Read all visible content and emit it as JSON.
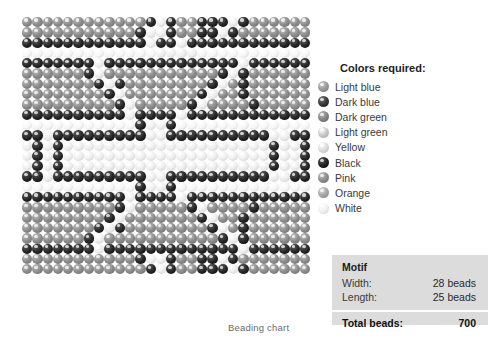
{
  "chart": {
    "caption": "Beading chart",
    "width_beads": 28,
    "length_beads": 25
  },
  "legend": {
    "title": "Colors required:",
    "items": [
      {
        "label": "Light blue",
        "color": "#9a9a9a"
      },
      {
        "label": "Dark blue",
        "color": "#3c3c3c"
      },
      {
        "label": "Dark green",
        "color": "#858585"
      },
      {
        "label": "Light green",
        "color": "#c9c9c9"
      },
      {
        "label": "Yellow",
        "color": "#dcdcdc"
      },
      {
        "label": "Black",
        "color": "#242424"
      },
      {
        "label": "Pink",
        "color": "#8e8e8e"
      },
      {
        "label": "Orange",
        "color": "#a8a8a8"
      },
      {
        "label": "White",
        "color": "#f2f2f2"
      }
    ]
  },
  "motif": {
    "title": "Motif",
    "width_label": "Width:",
    "width_value": "28 beads",
    "length_label": "Length:",
    "length_value": "25 beads",
    "total_label": "Total beads:",
    "total_value": "700"
  },
  "chart_data": {
    "type": "heatmap",
    "title": "Beading chart",
    "cols": 28,
    "rows": 25,
    "palette": {
      "D": "#2a2a2a",
      "d": "#4a4a4a",
      "m": "#8d8d8d",
      "l": "#bdbdbd",
      "w": "#efefef",
      "x": "#f7f7f7"
    },
    "palette_names": {
      "D": "Black",
      "d": "Dark blue",
      "m": "Light blue",
      "l": "Light green",
      "w": "White",
      "x": "Yellow"
    },
    "grid": [
      "mmmmmmmmmmmmDwDmmDDDwDmmmmmm",
      "mmmmmmmmmmmDwwDmmDDwDmmmmmmm",
      "DDDDDDDDDDDDwDDwDDDDDDDDDDDD",
      "xxxxxxxxxxxxxwwwwxxxxxxxxxxx",
      "DDDDDDDwDDDDDDDDDDDDDwDDDDDD",
      "mmmmmmDwmmmmmmmmmmmDwDmmmmmm",
      "mmmmmmmDwDmmmmmmmmDwmDmmmmmm",
      "mmmmmmmmDwmmmmmmmDwmmDmmmmmm",
      "mmmmmmmmmDwmmmmmDwmmmmDmmmmm",
      "DDDDDDDDDDwDDDDwDDDDDDDDDDDD",
      "xxxxxxxxxxxDwwDxxxxxxxxxxxxx",
      "DDwDDDDDDDDDwwDDDDDDDDDDwwDD",
      "wDwDwwwwwwwwwwwwwwwwwwwwDwwD",
      "wDwDwwwwwwwwwwwwwwwwwwwwDwwD",
      "wDwDwwwwwwwwwwwwwwwwwwwwDwwD",
      "DDwDDDDDDDDDwwDDDDDDDDDDwwDD",
      "xxxxxxxxxxxDwwDxxxxxxxxxxxxx",
      "DDDDDDDDDDwDDDDwDDDDDDDDDDDD",
      "mmmmmmmmmDwmmmmmDwmmmmDmmmmm",
      "mmmmmmmmDwmmmmmmmDwmmDmmmmmm",
      "mmmmmmmDwDmmmmmmmmDwmDmmmmmm",
      "mmmmmmDwmmmmmmmmmmmDwDmmmmmm",
      "DDDDDDDwDDDDDDDDDDDDDwDDDDDD",
      "mmmmmmmmmmmDwwDmmDDwDmmmmmmm",
      "mmmmmmmmmmmmDwDmmDDDwDmmmmmm"
    ]
  }
}
